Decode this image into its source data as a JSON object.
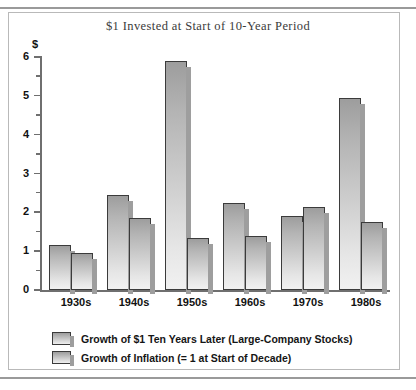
{
  "chart_data": {
    "type": "bar",
    "title": "$1 Invested at Start of 10-Year Period",
    "xlabel": "",
    "ylabel": "$",
    "ylim": [
      0,
      6
    ],
    "yticks": [
      0,
      1,
      2,
      3,
      4,
      5,
      6
    ],
    "ytick_labels": [
      "0",
      "1",
      "2",
      "3",
      "4",
      "5",
      "6"
    ],
    "minor_tick_step": 0.5,
    "grid": false,
    "legend_position": "bottom-left",
    "categories": [
      "1930s",
      "1940s",
      "1950s",
      "1960s",
      "1970s",
      "1980s"
    ],
    "series": [
      {
        "name": "Growth of $1 Ten Years Later (Large-Company Stocks)",
        "values": [
          1.15,
          2.45,
          5.9,
          2.25,
          1.9,
          4.95
        ]
      },
      {
        "name": "Growth of Inflation (= 1 at Start of Decade)",
        "values": [
          0.95,
          1.85,
          1.35,
          1.4,
          2.15,
          1.75
        ]
      }
    ]
  },
  "legend": {
    "items": [
      {
        "label": "Growth of $1 Ten Years Later (Large-Company Stocks)"
      },
      {
        "label": "Growth of Inflation (= 1 at Start of Decade)"
      }
    ]
  },
  "colors": {
    "bar_top": "#9d9d9d",
    "bar_bottom": "#f1f1f1",
    "bar_outline": "#3b3b3b",
    "shadow": "#9e9e9e",
    "axis": "#6f6f6f",
    "frame": "#b9b9b9",
    "rule": "#9a9a9a",
    "text": "#111111",
    "title_text": "#3a3a3a"
  }
}
